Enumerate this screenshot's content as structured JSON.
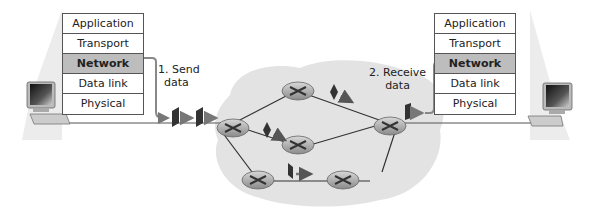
{
  "diagram": {
    "type": "network-layer-forwarding",
    "stacks": {
      "sender": {
        "layers": [
          {
            "label": "Application",
            "active": false
          },
          {
            "label": "Transport",
            "active": false
          },
          {
            "label": "Network",
            "active": true
          },
          {
            "label": "Data link",
            "active": false
          },
          {
            "label": "Physical",
            "active": false
          }
        ]
      },
      "receiver": {
        "layers": [
          {
            "label": "Application",
            "active": false
          },
          {
            "label": "Transport",
            "active": false
          },
          {
            "label": "Network",
            "active": true
          },
          {
            "label": "Data link",
            "active": false
          },
          {
            "label": "Physical",
            "active": false
          }
        ]
      }
    },
    "annotations": {
      "send": {
        "line1": "1. Send",
        "line2": "data"
      },
      "receive": {
        "line1": "2. Receive",
        "line2": "data"
      }
    },
    "icons": {
      "host": "computer-icon",
      "router": "router-icon",
      "packet": "packet-icon"
    },
    "colors": {
      "cloud": "#e3e3e3",
      "active_layer": "#bdbdbd",
      "link": "#333333",
      "arrow": "#888888"
    }
  }
}
